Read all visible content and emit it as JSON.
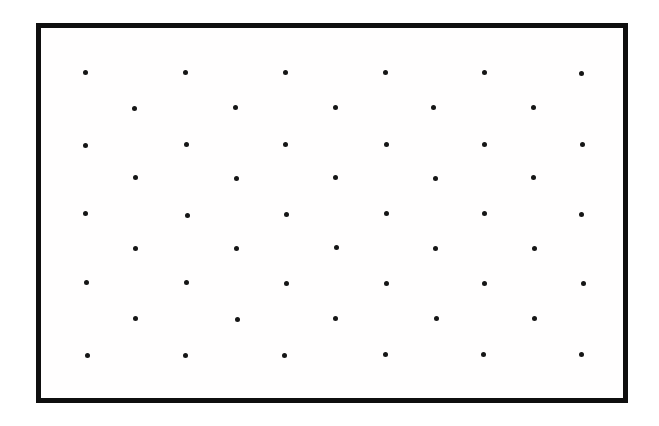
{
  "figure": {
    "background_color": "#ffffff",
    "frame": {
      "left": 36,
      "top": 23,
      "width": 592,
      "height": 380,
      "border_width": 5,
      "border_color": "#0f0f0f",
      "fill_color": "#fffefe"
    },
    "dot_style": {
      "diameter": 5,
      "color": "#161616"
    },
    "lattice": {
      "pattern": "centered-rectangular",
      "row_count": 9,
      "dots_in_even_rows": 6,
      "dots_in_odd_rows": 5,
      "horizontal_spacing": 100,
      "vertical_spacing": 35,
      "odd_row_x_offset": 50,
      "total_dots": 50,
      "dots": [
        {
          "x": 85,
          "y": 72
        },
        {
          "x": 185,
          "y": 72
        },
        {
          "x": 285,
          "y": 72
        },
        {
          "x": 385,
          "y": 72
        },
        {
          "x": 484,
          "y": 72
        },
        {
          "x": 581,
          "y": 73
        },
        {
          "x": 134,
          "y": 108
        },
        {
          "x": 235,
          "y": 107
        },
        {
          "x": 335,
          "y": 107
        },
        {
          "x": 433,
          "y": 107
        },
        {
          "x": 533,
          "y": 107
        },
        {
          "x": 85,
          "y": 145
        },
        {
          "x": 186,
          "y": 144
        },
        {
          "x": 285,
          "y": 144
        },
        {
          "x": 386,
          "y": 144
        },
        {
          "x": 484,
          "y": 144
        },
        {
          "x": 582,
          "y": 144
        },
        {
          "x": 135,
          "y": 177
        },
        {
          "x": 236,
          "y": 178
        },
        {
          "x": 335,
          "y": 177
        },
        {
          "x": 435,
          "y": 178
        },
        {
          "x": 533,
          "y": 177
        },
        {
          "x": 85,
          "y": 213
        },
        {
          "x": 187,
          "y": 215
        },
        {
          "x": 286,
          "y": 214
        },
        {
          "x": 386,
          "y": 213
        },
        {
          "x": 484,
          "y": 213
        },
        {
          "x": 581,
          "y": 214
        },
        {
          "x": 135,
          "y": 248
        },
        {
          "x": 236,
          "y": 248
        },
        {
          "x": 336,
          "y": 247
        },
        {
          "x": 435,
          "y": 248
        },
        {
          "x": 534,
          "y": 248
        },
        {
          "x": 86,
          "y": 282
        },
        {
          "x": 186,
          "y": 282
        },
        {
          "x": 286,
          "y": 283
        },
        {
          "x": 386,
          "y": 283
        },
        {
          "x": 484,
          "y": 283
        },
        {
          "x": 583,
          "y": 283
        },
        {
          "x": 135,
          "y": 318
        },
        {
          "x": 237,
          "y": 319
        },
        {
          "x": 335,
          "y": 318
        },
        {
          "x": 436,
          "y": 318
        },
        {
          "x": 534,
          "y": 318
        },
        {
          "x": 87,
          "y": 355
        },
        {
          "x": 185,
          "y": 355
        },
        {
          "x": 284,
          "y": 355
        },
        {
          "x": 385,
          "y": 354
        },
        {
          "x": 483,
          "y": 354
        },
        {
          "x": 581,
          "y": 354
        }
      ]
    }
  }
}
